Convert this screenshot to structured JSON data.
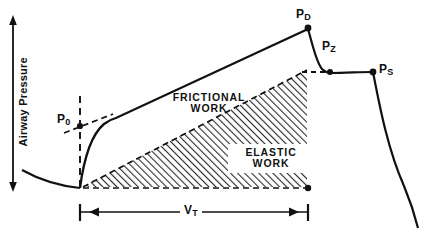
{
  "figure": {
    "axes": {
      "y_label": "Airway Pressure",
      "y_axis_icon": "double-arrow-vertical-icon"
    },
    "points": [
      {
        "id": "p0",
        "label": "P",
        "subscript": "0",
        "x": 80,
        "y": 126
      },
      {
        "id": "pd",
        "label": "P",
        "subscript": "D",
        "x": 308,
        "y": 28
      },
      {
        "id": "pz",
        "label": "P",
        "subscript": "Z",
        "x": 330,
        "y": 72
      },
      {
        "id": "ps",
        "label": "P",
        "subscript": "S",
        "x": 373,
        "y": 72
      }
    ],
    "regions": [
      {
        "id": "frictional",
        "line1": "FRICTIONAL",
        "line2": "WORK"
      },
      {
        "id": "elastic",
        "line1": "ELASTIC",
        "line2": "WORK"
      }
    ],
    "measure": {
      "id": "tidal-volume",
      "label": "V",
      "subscript": "T",
      "start_x": 80,
      "end_x": 308,
      "y": 212
    },
    "colors": {
      "ink": "#111111",
      "background": "#ffffff",
      "hatch": "#2b2b2b"
    },
    "geometry": {
      "baseline_y": 188,
      "left_curve_start_x": 22,
      "left_curve_start_y": 170,
      "dashed_vertical_x": 80,
      "dashed_vertical_top_y": 96,
      "knee_x": 115,
      "knee_y": 120,
      "peak_x": 308,
      "peak_y": 28,
      "plateau_y": 72,
      "exhale_end_x": 404,
      "exhale_end_y": 228
    }
  }
}
